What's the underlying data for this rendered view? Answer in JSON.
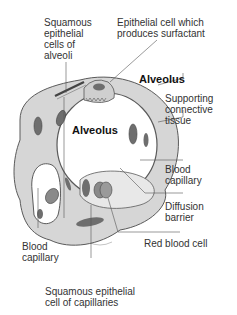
{
  "labels": {
    "squamous_alveoli": "Squamous\nepithelial\ncells of\nalveoli",
    "surfactant_cell": "Epithelial cell which\nproduces surfactant",
    "alveolus_right": "Alveolus",
    "alveolus_center": "Alveolus",
    "supporting_tissue": "Supporting\nconnective\ntissue",
    "blood_capillary_right": "Blood\ncapillary",
    "diffusion_barrier": "Diffusion\nbarrier",
    "red_blood_cell": "Red blood cell",
    "blood_capillary_left": "Blood\ncapillary",
    "squamous_capillaries": "Squamous epithelial\ncell of capillaries"
  },
  "colors": {
    "tissue_fill": "#d6d6d6",
    "tissue_stroke": "#5a5a5a",
    "nucleus": "#6e6e6e",
    "background": "#ffffff",
    "leader_line": "#555555"
  }
}
